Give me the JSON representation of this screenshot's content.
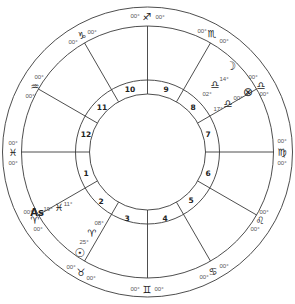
{
  "chart": {
    "center": [
      147.5,
      152
    ],
    "radii": {
      "outer": 145,
      "zodiac_inner": 126,
      "house_outer": 72,
      "house_inner": 58
    },
    "line_color": "#3a3a3a"
  },
  "houses": [
    {
      "num": "1",
      "x": 86,
      "y": 173
    },
    {
      "num": "2",
      "x": 101,
      "y": 201
    },
    {
      "num": "3",
      "x": 127,
      "y": 218
    },
    {
      "num": "4",
      "x": 165,
      "y": 218
    },
    {
      "num": "5",
      "x": 191,
      "y": 200
    },
    {
      "num": "6",
      "x": 208,
      "y": 173
    },
    {
      "num": "7",
      "x": 208,
      "y": 134
    },
    {
      "num": "8",
      "x": 193,
      "y": 107
    },
    {
      "num": "9",
      "x": 166,
      "y": 89
    },
    {
      "num": "10",
      "x": 130,
      "y": 89
    },
    {
      "num": "11",
      "x": 102,
      "y": 107
    },
    {
      "num": "12",
      "x": 86,
      "y": 134
    }
  ],
  "signs": [
    {
      "name": "sagittarius",
      "glyph": "♐",
      "x": 147,
      "y": 16,
      "deg_before": {
        "text": "00°",
        "x": 135,
        "y": 16
      },
      "deg_after": {
        "text": "00°",
        "x": 160,
        "y": 17
      }
    },
    {
      "name": "capricorn",
      "glyph": "♑",
      "x": 82,
      "y": 35,
      "deg_before": {
        "text": "00°",
        "x": 73,
        "y": 42
      },
      "deg_after": {
        "text": "00°",
        "x": 92,
        "y": 32
      }
    },
    {
      "name": "aquarius",
      "glyph": "♒",
      "x": 35,
      "y": 86,
      "deg_before": {
        "text": "00°",
        "x": 30,
        "y": 96
      },
      "deg_after": {
        "text": "00°",
        "x": 39,
        "y": 77
      }
    },
    {
      "name": "pisces",
      "glyph": "♓",
      "x": 13,
      "y": 152,
      "deg_before": {
        "text": "00°",
        "x": 13,
        "y": 143
      },
      "deg_after": {
        "text": "00°",
        "x": 13,
        "y": 163
      }
    },
    {
      "name": "aries",
      "glyph": "♈",
      "x": 35,
      "y": 220,
      "deg_before": {
        "text": "00°",
        "x": 28,
        "y": 212
      },
      "deg_after": {
        "text": "00°",
        "x": 38,
        "y": 229
      }
    },
    {
      "name": "taurus",
      "glyph": "♉",
      "x": 81,
      "y": 272,
      "deg_before": {
        "text": "00°",
        "x": 71,
        "y": 267
      },
      "deg_after": {
        "text": "00°",
        "x": 91,
        "y": 278
      }
    },
    {
      "name": "gemini",
      "glyph": "♊",
      "x": 147,
      "y": 289,
      "deg_before": {
        "text": "00°",
        "x": 135,
        "y": 289
      },
      "deg_after": {
        "text": "00°",
        "x": 159,
        "y": 289
      }
    },
    {
      "name": "cancer",
      "glyph": "♋",
      "x": 213,
      "y": 271,
      "deg_before": {
        "text": "00°",
        "x": 204,
        "y": 277
      },
      "deg_after": {
        "text": "00°",
        "x": 224,
        "y": 266
      }
    },
    {
      "name": "leo",
      "glyph": "♌",
      "x": 260,
      "y": 220,
      "deg_before": {
        "text": "00°",
        "x": 255,
        "y": 229
      },
      "deg_after": {
        "text": "00°",
        "x": 264,
        "y": 212
      }
    },
    {
      "name": "virgo",
      "glyph": "♍",
      "x": 282,
      "y": 152,
      "deg_before": {
        "text": "00°",
        "x": 282,
        "y": 163
      },
      "deg_after": {
        "text": "00°",
        "x": 282,
        "y": 141
      }
    },
    {
      "name": "libra",
      "glyph": "♎",
      "x": 261,
      "y": 85,
      "deg_before": {
        "text": "00°",
        "x": 264,
        "y": 94
      },
      "deg_after": {
        "text": "00°",
        "x": 253,
        "y": 77
      }
    },
    {
      "name": "scorpio",
      "glyph": "♏",
      "x": 212,
      "y": 33,
      "deg_before": {
        "text": "00°",
        "x": 224,
        "y": 41
      },
      "deg_after": {
        "text": "00°",
        "x": 202,
        "y": 31
      }
    }
  ],
  "placements": [
    {
      "body": "moon",
      "glyph": "☽",
      "x": 231,
      "y": 66,
      "labels": [
        {
          "text": "14°",
          "x": 224,
          "y": 79
        }
      ]
    },
    {
      "body": "libra-marker-1",
      "glyph": "♎",
      "x": 215,
      "y": 84,
      "labels": [
        {
          "text": "02°",
          "x": 207,
          "y": 94
        }
      ]
    },
    {
      "body": "part-of-fortune",
      "glyph": "⊗",
      "x": 248,
      "y": 92,
      "labels": [
        {
          "text": "00°",
          "x": 238,
          "y": 98
        }
      ]
    },
    {
      "body": "libra-marker-2",
      "glyph": "♎",
      "x": 228,
      "y": 103,
      "labels": [
        {
          "text": "17°",
          "x": 218,
          "y": 109
        }
      ]
    },
    {
      "body": "sun",
      "glyph": "☉",
      "x": 80,
      "y": 253,
      "labels": [
        {
          "text": "25°",
          "x": 84,
          "y": 242
        }
      ]
    },
    {
      "body": "aries-marker",
      "glyph": "♈",
      "x": 92,
      "y": 233,
      "labels": [
        {
          "text": "08°",
          "x": 99,
          "y": 223
        }
      ]
    },
    {
      "body": "pisces-marker",
      "glyph": "♓",
      "x": 59,
      "y": 207,
      "labels": [
        {
          "text": "19°",
          "x": 48,
          "y": 209
        },
        {
          "text": "11°",
          "x": 68,
          "y": 204
        }
      ]
    }
  ],
  "ascendant": {
    "label": "As",
    "x": 37,
    "y": 212
  }
}
